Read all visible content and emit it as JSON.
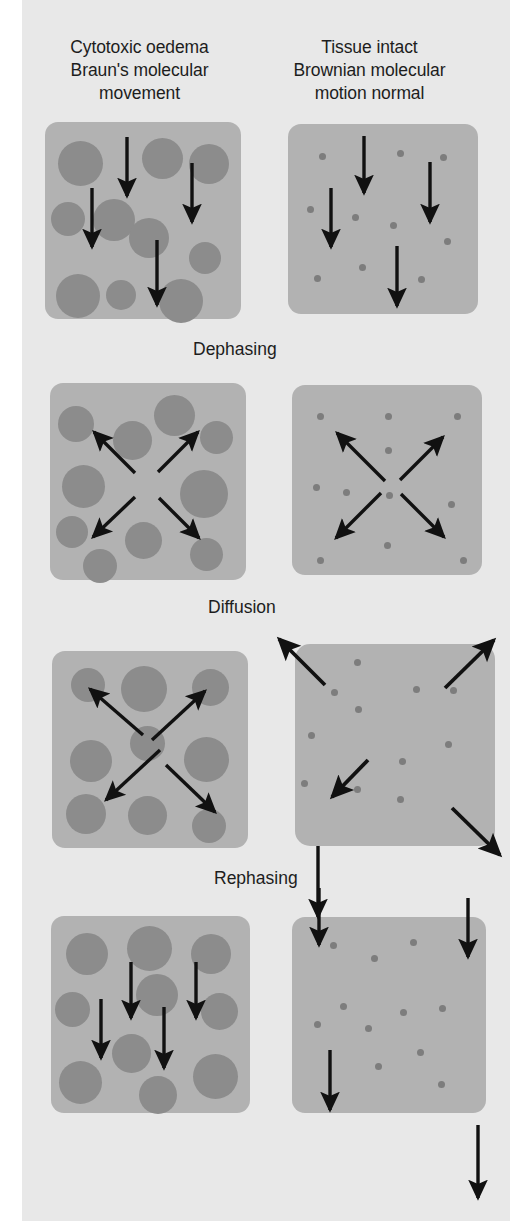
{
  "figure": {
    "width": 532,
    "height": 1221,
    "background": "#e8e8e8",
    "panel_color": "#b2b2b2",
    "blob_color": "#8c8c8c",
    "dot_color": "#7d7d7d",
    "arrow_color": "#111111"
  },
  "columns": {
    "left_title": "Cytotoxic oedema\nBraun's molecular\nmovement",
    "right_title": "Tissue intact\nBrownian molecular\nmotion normal"
  },
  "stages": [
    {
      "label": "Dephasing"
    },
    {
      "label": "Diffusion"
    },
    {
      "label": "Rephasing"
    }
  ],
  "rows": [
    {
      "name": "baseline",
      "left_panel": {
        "x": 45,
        "y": 122,
        "w": 196,
        "h": 197,
        "particle_type": "large-circles",
        "particle_count": 12,
        "arrow_pattern": "parallel-down",
        "arrow_count": 4
      },
      "right_panel": {
        "x": 288,
        "y": 124,
        "w": 190,
        "h": 190,
        "particle_type": "small-dots",
        "particle_count": 12,
        "arrow_pattern": "parallel-down",
        "arrow_count": 4
      }
    },
    {
      "name": "dephasing",
      "left_panel": {
        "x": 50,
        "y": 383,
        "w": 196,
        "h": 197,
        "particle_type": "large-circles",
        "particle_count": 12,
        "arrow_pattern": "radial-x",
        "arrow_count": 4
      },
      "right_panel": {
        "x": 292,
        "y": 385,
        "w": 190,
        "h": 190,
        "particle_type": "small-dots",
        "particle_count": 13,
        "arrow_pattern": "radial-x",
        "arrow_count": 4
      }
    },
    {
      "name": "diffusion",
      "left_panel": {
        "x": 52,
        "y": 651,
        "w": 196,
        "h": 197,
        "particle_type": "large-circles",
        "particle_count": 11,
        "arrow_pattern": "radial-x",
        "arrow_count": 4
      },
      "right_panel": {
        "x": 295,
        "y": 644,
        "w": 200,
        "h": 202,
        "particle_type": "small-dots",
        "particle_count": 14,
        "arrow_pattern": "radial-x-overflow",
        "arrow_count": 4
      }
    },
    {
      "name": "rephasing",
      "left_panel": {
        "x": 51,
        "y": 916,
        "w": 199,
        "h": 197,
        "particle_type": "large-circles",
        "particle_count": 12,
        "arrow_pattern": "parallel-down",
        "arrow_count": 4
      },
      "right_panel": {
        "x": 292,
        "y": 917,
        "w": 194,
        "h": 196,
        "particle_type": "small-dots",
        "particle_count": 13,
        "arrow_pattern": "parallel-down-overflow",
        "arrow_count": 4
      }
    }
  ],
  "connector_arrows": [
    {
      "name": "diffusion-to-rephasing",
      "from_y": 846,
      "to_y": 917,
      "x": 318
    },
    {
      "name": "final-down-arrow",
      "from_y": 1125,
      "to_y": 1200,
      "x": 478
    }
  ]
}
